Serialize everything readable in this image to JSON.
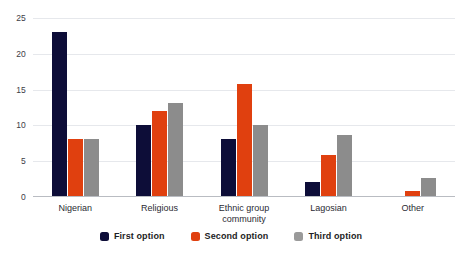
{
  "chart_data": {
    "type": "bar",
    "title": "",
    "subtitle": "",
    "xlabel": "",
    "ylabel": "",
    "ylim": [
      0,
      25
    ],
    "yticks": [
      0,
      5,
      10,
      15,
      20,
      25
    ],
    "grid": true,
    "legend_position": "bottom",
    "orientation": "vertical",
    "grouping": "grouped",
    "categories": [
      "Nigerian",
      "Religious",
      "Ethnic group\ncommunity",
      "Lagosian",
      "Other"
    ],
    "series": [
      {
        "name": "First option",
        "color": "#0d0d38",
        "values": [
          23,
          10,
          8,
          2,
          0
        ]
      },
      {
        "name": "Second option",
        "color": "#e0400f",
        "values": [
          8,
          12,
          15.8,
          5.7,
          0.7
        ]
      },
      {
        "name": "Third option",
        "color": "#8c8c8c",
        "values": [
          8,
          13,
          10,
          8.6,
          2.5
        ]
      }
    ]
  },
  "legend": {
    "items": [
      {
        "label": "First option",
        "color": "#0d0d38"
      },
      {
        "label": "Second option",
        "color": "#e0400f"
      },
      {
        "label": "Third option",
        "color": "#9a9a9a"
      }
    ]
  },
  "colors": {
    "first_option": "#0d0d38",
    "second_option": "#e0400f",
    "third_option": "#8c8c8c",
    "gridline": "#e6e8ec",
    "axis": "#b9bcc2",
    "background": "#ffffff",
    "tick_text": "#3c3c46"
  }
}
